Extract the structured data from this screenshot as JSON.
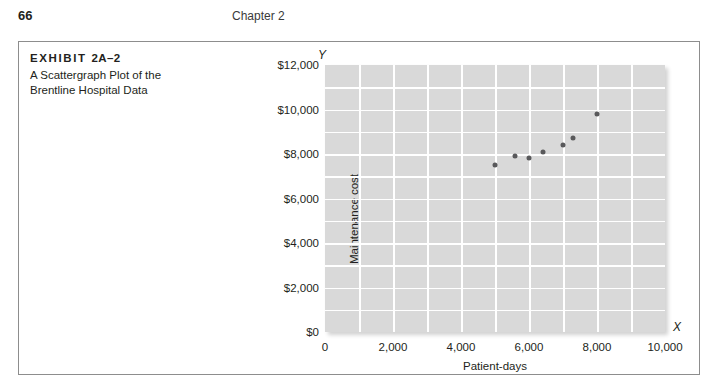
{
  "page": {
    "folio": "66",
    "running_head": "Chapter 2"
  },
  "exhibit": {
    "label_word": "EXHIBIT",
    "label_number": "2A–2",
    "subtitle_line1": "A Scattergraph Plot of the",
    "subtitle_line2": "Brentline Hospital Data"
  },
  "chart_data": {
    "type": "scatter",
    "title": "A Scattergraph Plot of the Brentline Hospital Data",
    "xlabel": "Patient-days",
    "ylabel": "Maintenance cost",
    "x_axis_letter": "X",
    "y_axis_letter": "Y",
    "xlim": [
      0,
      10000
    ],
    "ylim": [
      0,
      12000
    ],
    "x_ticks": [
      0,
      2000,
      4000,
      6000,
      8000,
      10000
    ],
    "x_tick_labels": [
      "0",
      "2,000",
      "4,000",
      "6,000",
      "8,000",
      "10,000"
    ],
    "y_ticks": [
      0,
      2000,
      4000,
      6000,
      8000,
      10000,
      12000
    ],
    "y_tick_labels": [
      "$0",
      "$2,000",
      "$4,000",
      "$6,000",
      "$8,000",
      "$10,000",
      "$12,000"
    ],
    "grid": true,
    "grid_x_step": 1000,
    "grid_y_step": 1000,
    "grid_color": "#ffffff",
    "plot_background": "#d9d9d9",
    "marker_color": "#59595b",
    "legend": null,
    "points": [
      {
        "x": 5000,
        "y": 7500
      },
      {
        "x": 5600,
        "y": 7900
      },
      {
        "x": 6000,
        "y": 7800
      },
      {
        "x": 6400,
        "y": 8100
      },
      {
        "x": 7000,
        "y": 8400
      },
      {
        "x": 7300,
        "y": 8700
      },
      {
        "x": 8000,
        "y": 9800
      }
    ]
  }
}
